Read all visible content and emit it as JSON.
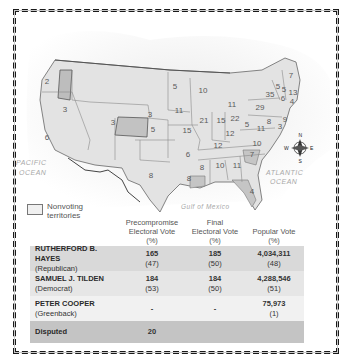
{
  "map": {
    "legend": {
      "label": "Nonvoting territories"
    },
    "oceans": {
      "pacific": [
        "PACIFIC",
        "OCEAN"
      ],
      "atlantic": [
        "ATLANTIC",
        "OCEAN"
      ],
      "gulf": "Gulf of Mexico"
    },
    "compass": {
      "n": "N",
      "s": "S",
      "e": "E",
      "w": "W"
    },
    "state_labels": [
      {
        "v": "2",
        "x": 47,
        "y": 84
      },
      {
        "v": "3",
        "x": 65,
        "y": 112
      },
      {
        "v": "6",
        "x": 47,
        "y": 140
      },
      {
        "v": "5",
        "x": 175,
        "y": 89
      },
      {
        "v": "10",
        "x": 203,
        "y": 93
      },
      {
        "v": "11",
        "x": 232,
        "y": 107
      },
      {
        "v": "3",
        "x": 150,
        "y": 117
      },
      {
        "v": "11",
        "x": 179,
        "y": 113
      },
      {
        "v": "3",
        "x": 113,
        "y": 125
      },
      {
        "v": "5",
        "x": 153,
        "y": 132
      },
      {
        "v": "15",
        "x": 187,
        "y": 133
      },
      {
        "v": "21",
        "x": 204,
        "y": 123
      },
      {
        "v": "15",
        "x": 221,
        "y": 123
      },
      {
        "v": "22",
        "x": 235,
        "y": 121
      },
      {
        "v": "29",
        "x": 260,
        "y": 110
      },
      {
        "v": "35",
        "x": 270,
        "y": 97
      },
      {
        "v": "7",
        "x": 291,
        "y": 78
      },
      {
        "v": "5",
        "x": 278,
        "y": 89
      },
      {
        "v": "5",
        "x": 284,
        "y": 92
      },
      {
        "v": "13",
        "x": 293,
        "y": 95
      },
      {
        "v": "6",
        "x": 283,
        "y": 101
      },
      {
        "v": "4",
        "x": 292,
        "y": 104
      },
      {
        "v": "9",
        "x": 285,
        "y": 122
      },
      {
        "v": "3",
        "x": 280,
        "y": 129
      },
      {
        "v": "8",
        "x": 269,
        "y": 124
      },
      {
        "v": "5",
        "x": 247,
        "y": 127
      },
      {
        "v": "11",
        "x": 261,
        "y": 131
      },
      {
        "v": "12",
        "x": 230,
        "y": 136
      },
      {
        "v": "12",
        "x": 218,
        "y": 148
      },
      {
        "v": "10",
        "x": 257,
        "y": 146
      },
      {
        "v": "6",
        "x": 188,
        "y": 157
      },
      {
        "v": "7",
        "x": 252,
        "y": 157
      },
      {
        "v": "8",
        "x": 202,
        "y": 170
      },
      {
        "v": "10",
        "x": 220,
        "y": 168
      },
      {
        "v": "11",
        "x": 237,
        "y": 168
      },
      {
        "v": "8",
        "x": 151,
        "y": 178
      },
      {
        "v": "8",
        "x": 189,
        "y": 181
      },
      {
        "v": "4",
        "x": 252,
        "y": 194
      }
    ]
  },
  "table": {
    "headers": [
      "",
      [
        "Precompromise",
        "Electoral Vote",
        "(%)"
      ],
      [
        "Final",
        "Electoral Vote",
        "(%)"
      ],
      [
        "",
        "Popular Vote",
        "(%)"
      ]
    ],
    "rows": [
      {
        "name": "RUTHERFORD B. HAYES",
        "party": "(Republican)",
        "pre": "165",
        "pre_pct": "(47)",
        "final": "185",
        "final_pct": "(50)",
        "pop": "4,034,311",
        "pop_pct": "(48)"
      },
      {
        "name": "SAMUEL J. TILDEN",
        "party": "(Democrat)",
        "pre": "184",
        "pre_pct": "(53)",
        "final": "184",
        "final_pct": "(50)",
        "pop": "4,288,546",
        "pop_pct": "(51)"
      },
      {
        "name": "PETER COOPER",
        "party": "(Greenback)",
        "pre": "-",
        "pre_pct": "",
        "final": "-",
        "final_pct": "",
        "pop": "75,973",
        "pop_pct": "(1)"
      },
      {
        "name": "Disputed",
        "party": "",
        "pre": "20",
        "pre_pct": "",
        "final": "",
        "final_pct": "",
        "pop": "",
        "pop_pct": ""
      }
    ]
  },
  "chart_data": {
    "type": "table",
    "columns": [
      "Candidate",
      "Party",
      "Precompromise Electoral Vote",
      "Precompromise Electoral Vote (%)",
      "Final Electoral Vote",
      "Final Electoral Vote (%)",
      "Popular Vote",
      "Popular Vote (%)"
    ],
    "rows": [
      [
        "Rutherford B. Hayes",
        "Republican",
        165,
        47,
        185,
        50,
        4034311,
        48
      ],
      [
        "Samuel J. Tilden",
        "Democrat",
        184,
        53,
        184,
        50,
        4288546,
        51
      ],
      [
        "Peter Cooper",
        "Greenback",
        null,
        null,
        null,
        null,
        75973,
        1
      ],
      [
        "Disputed",
        "",
        20,
        null,
        null,
        null,
        null,
        null
      ]
    ],
    "legend": [
      "Nonvoting territories"
    ],
    "annotations": [
      "PACIFIC OCEAN",
      "ATLANTIC OCEAN",
      "Gulf of Mexico"
    ]
  }
}
